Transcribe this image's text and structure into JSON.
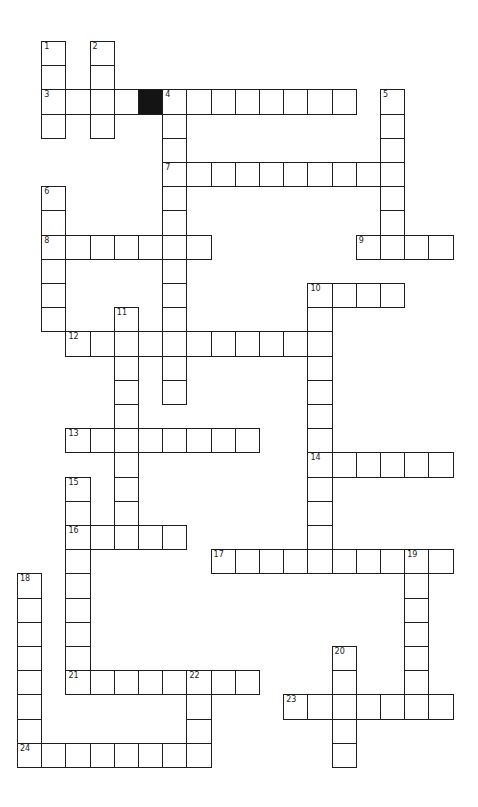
{
  "puzzle": {
    "type": "crossword",
    "grid": {
      "origin_x": 17,
      "origin_y": 41,
      "cell_size": 24.2,
      "colors": {
        "line": "#1e1e1e",
        "cell": "#ffffff",
        "block": "#141414"
      }
    },
    "blocks": [
      {
        "row": 2,
        "col": 5
      }
    ],
    "entries": [
      {
        "number": "1",
        "dir": "down",
        "row": 0,
        "col": 1,
        "length": 4
      },
      {
        "number": "2",
        "dir": "down",
        "row": 0,
        "col": 3,
        "length": 4
      },
      {
        "number": "3",
        "dir": "across",
        "row": 2,
        "col": 1,
        "length": 4
      },
      {
        "number": "4",
        "dir": "across",
        "row": 2,
        "col": 6,
        "length": 8
      },
      {
        "number": "4",
        "dir": "down",
        "row": 2,
        "col": 6,
        "length": 13
      },
      {
        "number": "5",
        "dir": "down",
        "row": 2,
        "col": 15,
        "length": 7
      },
      {
        "number": "6",
        "dir": "down",
        "row": 6,
        "col": 1,
        "length": 6
      },
      {
        "number": "7",
        "dir": "across",
        "row": 5,
        "col": 6,
        "length": 10
      },
      {
        "number": "8",
        "dir": "across",
        "row": 8,
        "col": 1,
        "length": 7
      },
      {
        "number": "9",
        "dir": "across",
        "row": 8,
        "col": 14,
        "length": 4
      },
      {
        "number": "10",
        "dir": "across",
        "row": 10,
        "col": 12,
        "length": 4
      },
      {
        "number": "10",
        "dir": "down",
        "row": 10,
        "col": 12,
        "length": 12
      },
      {
        "number": "11",
        "dir": "down",
        "row": 11,
        "col": 4,
        "length": 10
      },
      {
        "number": "12",
        "dir": "across",
        "row": 12,
        "col": 2,
        "length": 11
      },
      {
        "number": "13",
        "dir": "across",
        "row": 16,
        "col": 2,
        "length": 8
      },
      {
        "number": "14",
        "dir": "across",
        "row": 17,
        "col": 12,
        "length": 6
      },
      {
        "number": "15",
        "dir": "down",
        "row": 18,
        "col": 2,
        "length": 9
      },
      {
        "number": "16",
        "dir": "across",
        "row": 20,
        "col": 2,
        "length": 5
      },
      {
        "number": "17",
        "dir": "across",
        "row": 21,
        "col": 8,
        "length": 10
      },
      {
        "number": "18",
        "dir": "down",
        "row": 22,
        "col": 0,
        "length": 8
      },
      {
        "number": "19",
        "dir": "down",
        "row": 21,
        "col": 16,
        "length": 7
      },
      {
        "number": "20",
        "dir": "down",
        "row": 25,
        "col": 13,
        "length": 5
      },
      {
        "number": "21",
        "dir": "across",
        "row": 26,
        "col": 2,
        "length": 8
      },
      {
        "number": "22",
        "dir": "down",
        "row": 26,
        "col": 7,
        "length": 4
      },
      {
        "number": "23",
        "dir": "across",
        "row": 27,
        "col": 11,
        "length": 7
      },
      {
        "number": "24",
        "dir": "across",
        "row": 29,
        "col": 0,
        "length": 8
      }
    ]
  }
}
